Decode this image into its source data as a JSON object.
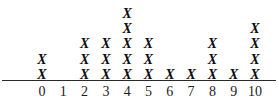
{
  "chart_data": {
    "type": "scatter",
    "plot_style": "dot-plot",
    "title": "",
    "subtitle": "",
    "xlabel": "",
    "ylabel": "",
    "categories": [
      "0",
      "1",
      "2",
      "3",
      "4",
      "5",
      "6",
      "7",
      "8",
      "9",
      "10"
    ],
    "values": [
      2,
      0,
      3,
      3,
      5,
      3,
      1,
      1,
      3,
      1,
      4
    ],
    "marker": "X",
    "marker_glyph": "✗",
    "total_count": 26,
    "xlim": [
      0,
      10
    ],
    "ylim": [
      0,
      5
    ],
    "grid": false,
    "legend": null,
    "annotations": [],
    "colors": {
      "marker": "#0d0d0d",
      "axis": "#2a2a2a",
      "label": "#1c1c1c",
      "background": "#ffffff"
    }
  },
  "axis": {
    "line_name": "horizontal-axis-line",
    "tick_labels": [
      "0",
      "1",
      "2",
      "3",
      "4",
      "5",
      "6",
      "7",
      "8",
      "9",
      "10"
    ]
  },
  "columns": [
    {
      "label": "0",
      "count": 2,
      "marks": [
        "X",
        "X"
      ]
    },
    {
      "label": "1",
      "count": 0,
      "marks": []
    },
    {
      "label": "2",
      "count": 3,
      "marks": [
        "X",
        "X",
        "X"
      ]
    },
    {
      "label": "3",
      "count": 3,
      "marks": [
        "X",
        "X",
        "X"
      ]
    },
    {
      "label": "4",
      "count": 5,
      "marks": [
        "X",
        "X",
        "X",
        "X",
        "X"
      ]
    },
    {
      "label": "5",
      "count": 3,
      "marks": [
        "X",
        "X",
        "X"
      ]
    },
    {
      "label": "6",
      "count": 1,
      "marks": [
        "X"
      ]
    },
    {
      "label": "7",
      "count": 1,
      "marks": [
        "X"
      ]
    },
    {
      "label": "8",
      "count": 3,
      "marks": [
        "X",
        "X",
        "X"
      ]
    },
    {
      "label": "9",
      "count": 1,
      "marks": [
        "X"
      ]
    },
    {
      "label": "10",
      "count": 4,
      "marks": [
        "X",
        "X",
        "X",
        "X"
      ]
    }
  ]
}
